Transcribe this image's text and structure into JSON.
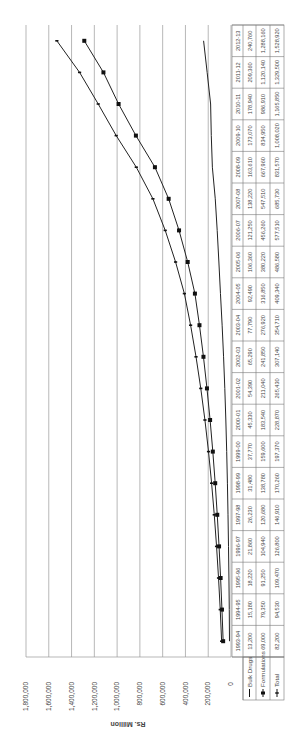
{
  "chart_data": {
    "type": "line",
    "orientation": "rotated-90-ccw",
    "title": "",
    "xlabel": "",
    "ylabel": "Rs. Million",
    "ylim": [
      0,
      1800000
    ],
    "yticks": [
      0,
      200000,
      400000,
      600000,
      800000,
      1000000,
      1200000,
      1400000,
      1600000,
      1800000
    ],
    "ytick_labels": [
      "0",
      "200,000",
      "400,000",
      "600,000",
      "800,000",
      "1,000,000",
      "1,200,000",
      "1,400,000",
      "1,600,000",
      "1,800,000"
    ],
    "grid": true,
    "legend_position": "data-table-left",
    "categories": [
      "1993-94",
      "1994-95",
      "1995-96",
      "1996-97",
      "1997-98",
      "1998-99",
      "1999-00",
      "2000-01",
      "2001-02",
      "2002-03",
      "2003-04",
      "2004-05",
      "2005-06",
      "2006-07",
      "2007-08",
      "2008-09",
      "2009-10",
      "2010-11",
      "2011-12",
      "2012-13"
    ],
    "series": [
      {
        "name": "Bulk Drugs",
        "marker": "none",
        "values": [
          13200,
          15180,
          18220,
          21860,
          26230,
          31480,
          37770,
          45330,
          54390,
          65290,
          77790,
          92490,
          106360,
          121250,
          138220,
          163610,
          173070,
          178940,
          209360,
          240760
        ],
        "labels": [
          "13,200",
          "15,180",
          "18,220",
          "21,860",
          "26,230",
          "31,480",
          "37,770",
          "45,330",
          "54,390",
          "65,290",
          "77,790",
          "92,490",
          "106,360",
          "121,250",
          "138,220",
          "163,610",
          "173,070",
          "178,940",
          "209,360",
          "240,760"
        ]
      },
      {
        "name": "Formulations",
        "marker": "square",
        "values": [
          69000,
          79350,
          91250,
          104940,
          120680,
          138780,
          159600,
          183540,
          211040,
          241850,
          276920,
          316850,
          380220,
          456260,
          547510,
          667960,
          834950,
          986910,
          1120140,
          1288160
        ],
        "labels": [
          "69,000",
          "79,350",
          "91,250",
          "104,940",
          "120,680",
          "138,780",
          "159,600",
          "183,540",
          "211,040",
          "241,850",
          "276,920",
          "316,850",
          "380,220",
          "456,260",
          "547,510",
          "667,960",
          "834,950",
          "986,910",
          "1,120,140",
          "1,288,160"
        ]
      },
      {
        "name": "Total",
        "marker": "dash",
        "values": [
          82200,
          94530,
          109470,
          126800,
          146910,
          170260,
          197370,
          228870,
          265430,
          307140,
          354710,
          409340,
          486580,
          577510,
          685730,
          831570,
          1008020,
          1165850,
          1329500,
          1528920
        ],
        "labels": [
          "82,200",
          "94,530",
          "109,470",
          "126,800",
          "146,910",
          "170,260",
          "197,370",
          "228,870",
          "265,430",
          "307,140",
          "354,710",
          "409,340",
          "486,580",
          "577,510",
          "685,730",
          "831,570",
          "1,008,020",
          "1,165,850",
          "1,329,500",
          "1,528,920"
        ]
      }
    ]
  }
}
